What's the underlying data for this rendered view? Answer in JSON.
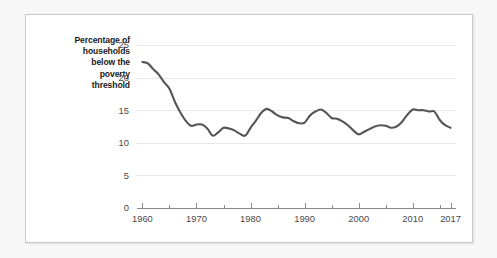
{
  "figure": {
    "axis_title": "Percentage of\nhouseholds\nbelow the\npoverty\nthreshold",
    "line_color": "#555555",
    "grid_color": "#e8e8e8",
    "axis_color": "#8a8a8a",
    "card_background": "#ffffff",
    "page_background": "#f7f7f7"
  },
  "chart_data": {
    "type": "line",
    "title": "",
    "subtitle": "",
    "xlabel": "",
    "ylabel": "Percentage of households below the poverty threshold",
    "xlim": [
      1959,
      2018
    ],
    "ylim": [
      0,
      26
    ],
    "grid": true,
    "legend": "none",
    "y_ticks": [
      0,
      5,
      10,
      15,
      20,
      25
    ],
    "y_tick_labels": [
      "0",
      "5",
      "10",
      "15",
      "20",
      "25"
    ],
    "x_ticks": [
      1960,
      1970,
      1980,
      1990,
      2000,
      2010,
      2017
    ],
    "x_tick_labels": [
      "1960",
      "1970",
      "1980",
      "1990",
      "2000",
      "2010",
      "2017"
    ],
    "x_minor_ticks": [
      1965,
      1975,
      1985,
      1995,
      2005,
      2015
    ],
    "series": [
      {
        "name": "Percentage of households below the poverty threshold",
        "color": "#555555",
        "x": [
          1960,
          1961,
          1962,
          1963,
          1964,
          1965,
          1966,
          1967,
          1968,
          1969,
          1970,
          1971,
          1972,
          1973,
          1974,
          1975,
          1976,
          1977,
          1978,
          1979,
          1980,
          1981,
          1982,
          1983,
          1984,
          1985,
          1986,
          1987,
          1988,
          1989,
          1990,
          1991,
          1992,
          1993,
          1994,
          1995,
          1996,
          1997,
          1998,
          1999,
          2000,
          2001,
          2002,
          2003,
          2004,
          2005,
          2006,
          2007,
          2008,
          2009,
          2010,
          2011,
          2012,
          2013,
          2014,
          2015,
          2016,
          2017
        ],
        "values": [
          22.4,
          22.2,
          21.3,
          20.5,
          19.3,
          18.3,
          16.3,
          14.7,
          13.4,
          12.6,
          12.8,
          12.8,
          12.2,
          11.1,
          11.6,
          12.3,
          12.2,
          11.9,
          11.4,
          11.1,
          12.3,
          13.4,
          14.6,
          15.2,
          14.8,
          14.2,
          13.9,
          13.8,
          13.3,
          13.0,
          13.1,
          14.2,
          14.8,
          15.1,
          14.6,
          13.8,
          13.7,
          13.3,
          12.7,
          11.9,
          11.3,
          11.7,
          12.1,
          12.5,
          12.7,
          12.6,
          12.3,
          12.5,
          13.2,
          14.3,
          15.1,
          15.0,
          15.0,
          14.8,
          14.8,
          13.5,
          12.7,
          12.3
        ]
      }
    ]
  }
}
